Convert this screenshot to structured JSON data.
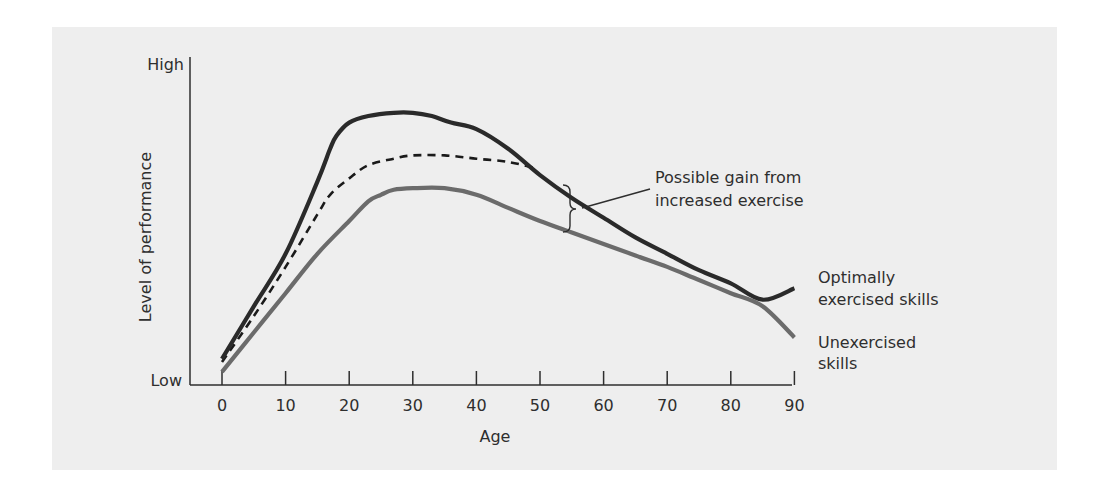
{
  "chart_data": {
    "type": "line",
    "title": "",
    "xlabel": "Age",
    "ylabel": "Level of performance",
    "x_ticks": [
      0,
      10,
      20,
      30,
      40,
      50,
      60,
      70,
      80,
      90
    ],
    "xlim": [
      0,
      90
    ],
    "y_tick_labels": {
      "low": "Low",
      "high": "High"
    },
    "ylim": [
      0,
      100
    ],
    "grid": false,
    "legend_position": "inline-right",
    "series": [
      {
        "name": "Optimally exercised skills",
        "label_lines": [
          "Optimally",
          "exercised skills"
        ],
        "style": "solid",
        "color": "#2a2a2a",
        "points": [
          [
            0,
            8
          ],
          [
            5,
            24
          ],
          [
            10,
            40
          ],
          [
            15,
            62
          ],
          [
            17,
            72
          ],
          [
            18,
            76
          ],
          [
            20,
            80
          ],
          [
            23,
            82
          ],
          [
            27,
            83
          ],
          [
            30,
            83
          ],
          [
            33,
            82
          ],
          [
            36,
            80
          ],
          [
            40,
            78
          ],
          [
            45,
            72
          ],
          [
            50,
            64
          ],
          [
            55,
            57
          ],
          [
            60,
            51
          ],
          [
            65,
            45
          ],
          [
            70,
            40
          ],
          [
            75,
            35
          ],
          [
            80,
            31
          ],
          [
            85,
            26
          ],
          [
            90,
            29.5
          ]
        ]
      },
      {
        "name": "Possible gain from increased exercise",
        "style": "dashed",
        "color": "#1a1a1a",
        "points": [
          [
            0,
            7
          ],
          [
            5,
            21
          ],
          [
            10,
            36
          ],
          [
            15,
            52
          ],
          [
            17,
            58
          ],
          [
            20,
            63
          ],
          [
            23,
            67
          ],
          [
            27,
            69
          ],
          [
            30,
            70
          ],
          [
            35,
            70
          ],
          [
            40,
            69
          ],
          [
            45,
            68
          ],
          [
            49.5,
            66
          ]
        ]
      },
      {
        "name": "Unexercised skills",
        "label_lines": [
          "Unexercised",
          "skills"
        ],
        "style": "solid",
        "color": "#6b6b6b",
        "points": [
          [
            0,
            4
          ],
          [
            5,
            16
          ],
          [
            10,
            28
          ],
          [
            15,
            40
          ],
          [
            20,
            50
          ],
          [
            23,
            56
          ],
          [
            25,
            58
          ],
          [
            27,
            59.5
          ],
          [
            30,
            60
          ],
          [
            35,
            60
          ],
          [
            40,
            58
          ],
          [
            45,
            54
          ],
          [
            50,
            50
          ],
          [
            55,
            46.5
          ],
          [
            60,
            43
          ],
          [
            65,
            39.5
          ],
          [
            70,
            36
          ],
          [
            75,
            32
          ],
          [
            80,
            28
          ],
          [
            85,
            24
          ],
          [
            90,
            14.5
          ]
        ]
      }
    ],
    "annotations": [
      {
        "text_lines": [
          "Possible gain from",
          "increased exercise"
        ],
        "type": "brace-callout",
        "target_age": 55
      }
    ]
  }
}
